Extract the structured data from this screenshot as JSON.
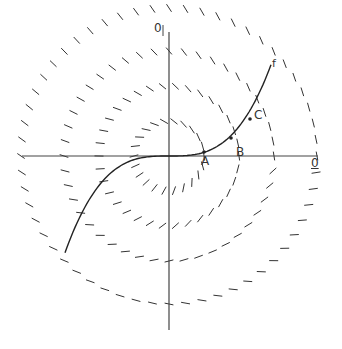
{
  "diagram": {
    "origin": {
      "x": 169,
      "y": 156
    },
    "axes": {
      "horizontal": {
        "x1": 22,
        "x2": 318,
        "y": 156
      },
      "vertical": {
        "x": 169,
        "y1": 32,
        "y2": 330
      },
      "color": "#444444"
    },
    "labels": {
      "top_axis": "0",
      "right_axis": "0",
      "curve": "f",
      "point_a": "A",
      "point_b": "B",
      "point_c": "C"
    },
    "level_circles": [
      {
        "radius": 35,
        "marks": 22
      },
      {
        "radius": 70,
        "marks": 34
      },
      {
        "radius": 105,
        "marks": 44
      },
      {
        "radius": 148,
        "marks": 56
      }
    ],
    "curve_f": {
      "description": "cubic curve through origin",
      "x_start": 65,
      "x_end": 272,
      "color": "#222222"
    },
    "points": [
      {
        "name": "A",
        "x": 204,
        "y": 152
      },
      {
        "name": "B",
        "x": 231,
        "y": 138
      },
      {
        "name": "C",
        "x": 250,
        "y": 119
      }
    ],
    "stroke_color": "#333333"
  }
}
